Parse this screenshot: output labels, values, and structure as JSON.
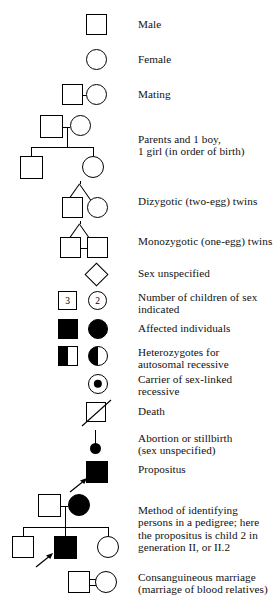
{
  "figure": {
    "type": "pedigree-symbol-key",
    "stroke_color": "#000000",
    "fill_color": "#000000",
    "background_color": "#ffffff"
  },
  "entries": [
    {
      "id": "male",
      "label": "Male",
      "symbol": "square-open"
    },
    {
      "id": "female",
      "label": "Female",
      "symbol": "circle-open"
    },
    {
      "id": "mating",
      "label": "Mating",
      "symbol": "square-line-circle"
    },
    {
      "id": "parents-children",
      "label": "Parents and 1 boy,\n1 girl (in order of birth)",
      "symbol": "pedigree-two-children"
    },
    {
      "id": "dizygotic-twins",
      "label": "Dizygotic (two-egg) twins",
      "symbol": "twins-v-square-circle"
    },
    {
      "id": "monozygotic-twins",
      "label": "Monozygotic (one-egg) twins",
      "symbol": "twins-v-square-square-joined"
    },
    {
      "id": "sex-unspecified",
      "label": "Sex unspecified",
      "symbol": "diamond-open"
    },
    {
      "id": "number-of-children",
      "label": "Number of children of sex\nindicated",
      "symbol": "square-number-circle-number",
      "square_number": "3",
      "circle_number": "2"
    },
    {
      "id": "affected-individuals",
      "label": "Affected individuals",
      "symbol": "square-filled-circle-filled"
    },
    {
      "id": "heterozygotes",
      "label": "Heterozygotes for\nautosomal recessive",
      "symbol": "square-half-circle-half"
    },
    {
      "id": "carrier-sex-linked",
      "label": "Carrier of sex-linked\nrecessive",
      "symbol": "circle-with-center-dot"
    },
    {
      "id": "death",
      "label": "Death",
      "symbol": "square-with-diagonal-slash"
    },
    {
      "id": "abortion-stillbirth",
      "label": "Abortion or stillbirth\n(sex unspecified)",
      "symbol": "small-filled-dot-on-stem"
    },
    {
      "id": "propositus",
      "label": "Propositus",
      "symbol": "square-filled-with-arrow"
    },
    {
      "id": "identifying-persons",
      "label": "Method of identifying\npersons in a pedigree; here\nthe propositus is child 2 in\ngeneration II, or II.2",
      "symbol": "pedigree-three-children-propositus"
    },
    {
      "id": "consanguineous-marriage",
      "label": "Consanguineous marriage\n(marriage of blood relatives)",
      "symbol": "square-double-line-circle"
    }
  ]
}
